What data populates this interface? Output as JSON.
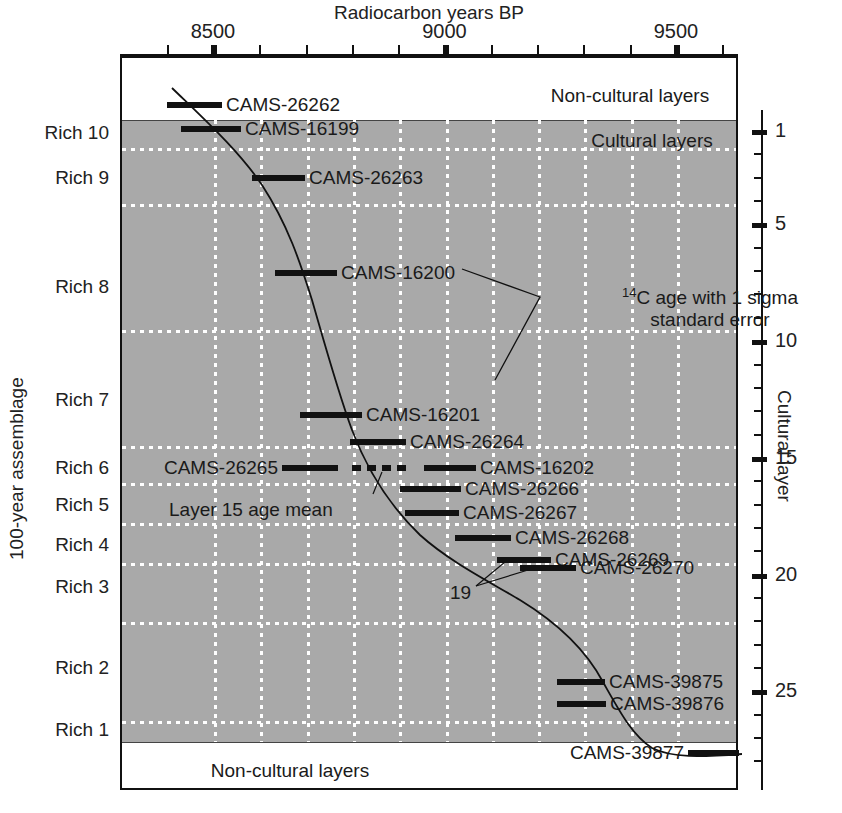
{
  "figure": {
    "top_axis_title": "Radiocarbon years BP",
    "left_axis_title": "100-year assemblage",
    "right_axis_title": "Cultural layer",
    "band_top_text": "Non-cultural layers",
    "band_inside_text": "Cultural layers",
    "band_bottom_text": "Non-cultural layers",
    "annotation_line1_pre": "14",
    "annotation_line1_post": "C age with 1 sigma",
    "annotation_line2": "standard error",
    "mean_annotation": "Layer 15 age mean",
    "layer19_annotation": "19"
  },
  "chart_data": {
    "type": "scatter",
    "title": "",
    "xlabel": "Radiocarbon years BP",
    "ylabel": "100-year assemblage",
    "y2label": "Cultural layer",
    "xlim": [
      8300,
      9600
    ],
    "grid": "dotted white vertical at every 100 years; dotted white horizontal at assemblage boundaries",
    "legend": "none",
    "x_major_ticks": [
      8500,
      9000,
      9500
    ],
    "x_minor_ticks": [
      8400,
      8600,
      8700,
      8800,
      8900,
      9100,
      9200,
      9300,
      9400,
      9600
    ],
    "y2_major_ticks": [
      1,
      5,
      10,
      15,
      20,
      25
    ],
    "y_categories": [
      "Rich 10",
      "Rich 9",
      "Rich 8",
      "Rich 7",
      "Rich 6",
      "Rich 5",
      "Rich 4",
      "Rich 3",
      "Rich 2",
      "Rich 1"
    ],
    "samples": [
      {
        "label": "CAMS-26262",
        "age": 8430,
        "sigma": 60,
        "x1": 167,
        "x2": 222,
        "y": 105,
        "label_x": 226,
        "align": "left"
      },
      {
        "label": "CAMS-16199",
        "age": 8460,
        "sigma": 65,
        "x1": 181,
        "x2": 241,
        "y": 129,
        "label_x": 245,
        "align": "left"
      },
      {
        "label": "CAMS-26263",
        "age": 8615,
        "sigma": 55,
        "x1": 252,
        "x2": 305,
        "y": 178,
        "label_x": 309,
        "align": "left"
      },
      {
        "label": "CAMS-16200",
        "age": 8680,
        "sigma": 65,
        "x1": 275,
        "x2": 337,
        "y": 273,
        "label_x": 341,
        "align": "left"
      },
      {
        "label": "CAMS-16201",
        "age": 8760,
        "sigma": 65,
        "x1": 300,
        "x2": 362,
        "y": 415,
        "label_x": 366,
        "align": "left"
      },
      {
        "label": "CAMS-26264",
        "age": 8815,
        "sigma": 60,
        "x1": 350,
        "x2": 406,
        "y": 442,
        "label_x": 410,
        "align": "left"
      },
      {
        "label": "CAMS-26265",
        "age": 8680,
        "sigma": 58,
        "x1": 282,
        "x2": 338,
        "y": 468,
        "label_x": 278,
        "align": "right"
      },
      {
        "label": "CAMS-16202",
        "age": 8880,
        "sigma": 55,
        "x1": 424,
        "x2": 476,
        "y": 468,
        "label_x": 480,
        "align": "left"
      },
      {
        "label": "CAMS-26266",
        "age": 8855,
        "sigma": 62,
        "x1": 400,
        "x2": 461,
        "y": 489,
        "label_x": 465,
        "align": "left"
      },
      {
        "label": "CAMS-26267",
        "age": 8860,
        "sigma": 55,
        "x1": 405,
        "x2": 459,
        "y": 513,
        "label_x": 463,
        "align": "left"
      },
      {
        "label": "CAMS-26268",
        "age": 8965,
        "sigma": 58,
        "x1": 455,
        "x2": 511,
        "y": 538,
        "label_x": 515,
        "align": "left"
      },
      {
        "label": "CAMS-26269",
        "age": 9055,
        "sigma": 55,
        "x1": 497,
        "x2": 551,
        "y": 560,
        "label_x": 555,
        "align": "left"
      },
      {
        "label": "CAMS-26270",
        "age": 9105,
        "sigma": 58,
        "x1": 520,
        "x2": 576,
        "y": 568,
        "label_x": 580,
        "align": "left"
      },
      {
        "label": "CAMS-39875",
        "age": 9230,
        "sigma": 50,
        "x1": 557,
        "x2": 605,
        "y": 682,
        "label_x": 609,
        "align": "left"
      },
      {
        "label": "CAMS-39876",
        "age": 9230,
        "sigma": 50,
        "x1": 557,
        "x2": 606,
        "y": 704,
        "label_x": 610,
        "align": "left"
      },
      {
        "label": "CAMS-39877",
        "age": 9515,
        "sigma": 52,
        "x1": 688,
        "x2": 739,
        "y": 753,
        "label_x": 684,
        "align": "right"
      }
    ],
    "mean_bar": {
      "label": "Layer 15 age mean",
      "x1": 352,
      "x2": 411,
      "y": 468,
      "style": "dashed"
    },
    "trend_curve_note": "Smooth monotonic age-depth curve through the dated samples"
  },
  "colors": {
    "cultural_band": "#a9a9a9",
    "bar": "#111111",
    "grid": "#ffffff",
    "frame": "#111111"
  }
}
